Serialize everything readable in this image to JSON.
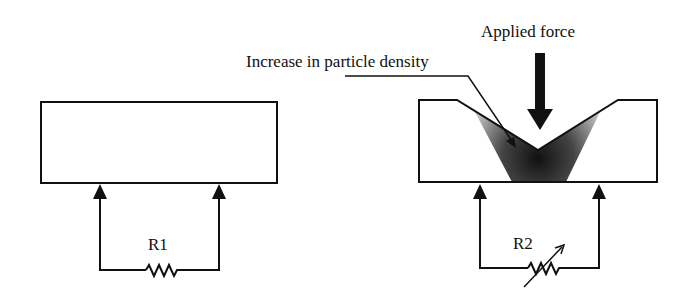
{
  "labels": {
    "applied_force": "Applied force",
    "density": "Increase in particle density",
    "r1": "R1",
    "r2": "R2"
  },
  "colors": {
    "stroke": "#111111",
    "background": "#ffffff",
    "gradient_dark": "#111111",
    "gradient_light": "#cfcfcf"
  }
}
